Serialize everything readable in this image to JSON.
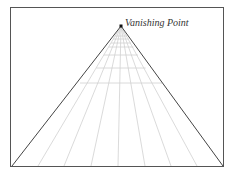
{
  "diagram": {
    "vanishing_point_label": "Vanishing Point",
    "colors": {
      "frame": "#555555",
      "edges": "#444444",
      "grid": "#cfcfcf",
      "point": "#111111"
    }
  }
}
